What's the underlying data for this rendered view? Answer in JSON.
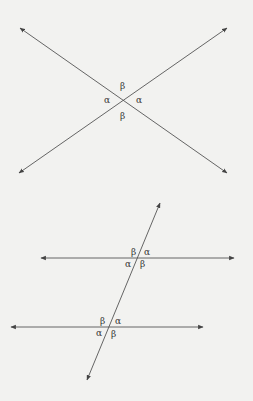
{
  "figure1": {
    "description": "Two intersecting lines forming vertical angles",
    "labels": {
      "top": "β",
      "left": "α",
      "right": "α",
      "bottom": "β"
    }
  },
  "figure2": {
    "description": "Two parallel lines cut by a transversal",
    "upper_intersection": {
      "top_left": "β",
      "top_right": "α",
      "bottom_left": "α",
      "bottom_right": "β"
    },
    "lower_intersection": {
      "top_left": "β",
      "top_right": "α",
      "bottom_left": "α",
      "bottom_right": "β"
    }
  },
  "colors": {
    "line": "#555555",
    "background": "#f2f2f0",
    "text": "#333333"
  }
}
